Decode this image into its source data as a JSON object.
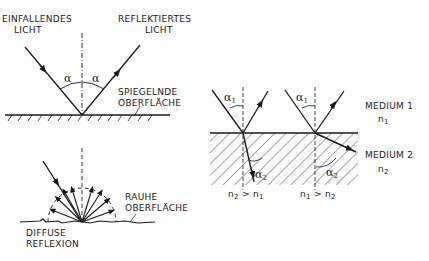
{
  "figure": {
    "specular": {
      "incident_label": [
        "EINFALLENDES",
        "LICHT"
      ],
      "reflected_label": [
        "REFLEKTIERTES",
        "LICHT"
      ],
      "surface_label": [
        "SPIEGELNDE",
        "OBERFLÄCHE"
      ],
      "angle_symbol": "α"
    },
    "diffuse": {
      "surface_label": [
        "RAUHE",
        "OBERFLÄCHE"
      ],
      "caption": [
        "DIFFUSE",
        "REFLEXION"
      ]
    },
    "refraction": {
      "medium1": "MEDIUM 1",
      "medium1_index": "n",
      "medium1_index_sub": "1",
      "medium2": "MEDIUM 2",
      "medium2_index": "n",
      "medium2_index_sub": "2",
      "angle1": "α",
      "angle1_sub": "1",
      "angle2": "α",
      "angle2_sub": "2",
      "case_left": {
        "a": "n",
        "a_sub": "2",
        "op": " > ",
        "b": "n",
        "b_sub": "1"
      },
      "case_right": {
        "a": "n",
        "a_sub": "1",
        "op": " > ",
        "b": "n",
        "b_sub": "2"
      }
    },
    "colors": {
      "ink": "#1a1a1a",
      "background": "#ffffff"
    }
  }
}
